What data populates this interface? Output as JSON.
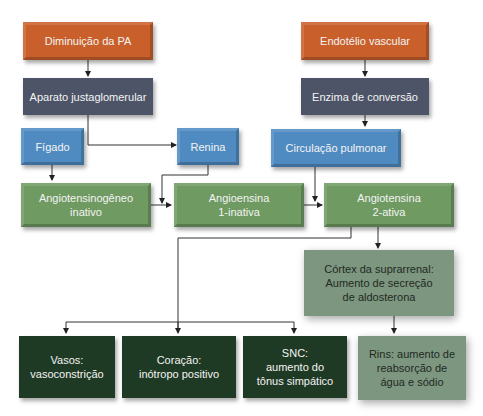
{
  "diagram": {
    "nodes": {
      "diminuicao_pa": "Diminuição da PA",
      "endotelio": "Endotélio vascular",
      "aparato": "Aparato justaglomerular",
      "enzima": "Enzima de conversão",
      "figado": "Fígado",
      "renina": "Renina",
      "circulacao": "Circulação pulmonar",
      "angiotensinogeneo_l1": "Angiotensinogêneo",
      "angiotensinogeneo_l2": "inativo",
      "angio1_l1": "Angioensina",
      "angio1_l2": "1-inativa",
      "angio2_l1": "Angiotensina",
      "angio2_l2": "2-ativa",
      "cortex_l1": "Córtex da suprarrenal:",
      "cortex_l2": "Aumento de secreção",
      "cortex_l3": "de aldosterona",
      "vasos_l1": "Vasos:",
      "vasos_l2": "vasoconstrição",
      "coracao_l1": "Coração:",
      "coracao_l2": "inótropo positivo",
      "snc_l1": "SNC:",
      "snc_l2": "aumento do",
      "snc_l3": "tônus simpático",
      "rins_l1": "Rins: aumento de",
      "rins_l2": "reabsorção de",
      "rins_l3": "água e sódio"
    },
    "colors": {
      "trigger": "#c9602b",
      "mediator": "#4d5468",
      "organ": "#4f8bc1",
      "substance": "#6f9a62",
      "adrenal": "#7d9680",
      "effect": "#1f3a24"
    }
  }
}
